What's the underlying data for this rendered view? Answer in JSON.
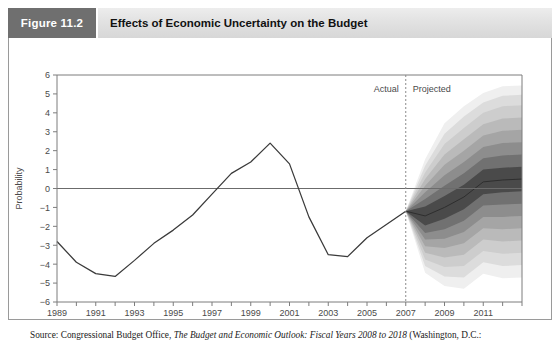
{
  "figure": {
    "tag_label": "Figure 11.2",
    "title": "Effects of Economic Uncertainty on the Budget",
    "tag_bg": "#6f6f6f",
    "title_bg": "#e2e2e2"
  },
  "source": {
    "prefix": "Source: Congressional Budget Office, ",
    "italic_title": "The Budget and Economic Outlook: Fiscal Years 2008 to 2018",
    "suffix": " (Washington, D.C.:"
  },
  "annotations": {
    "actual_label": "Actual",
    "projected_label": "Projected",
    "divider_year": 2007
  },
  "chart_data": {
    "type": "line",
    "title": "Effects of Economic Uncertainty on the Budget",
    "xlabel": "",
    "ylabel": "Probability",
    "xlim": [
      1989,
      2013
    ],
    "ylim": [
      -6,
      6
    ],
    "grid": false,
    "legend": "none",
    "zero_line": 0,
    "x_ticks": [
      1989,
      1990,
      1991,
      1992,
      1993,
      1994,
      1995,
      1996,
      1997,
      1998,
      1999,
      2000,
      2001,
      2002,
      2003,
      2004,
      2005,
      2006,
      2007,
      2008,
      2009,
      2010,
      2011,
      2012,
      2013
    ],
    "x_tick_labels": [
      "1989",
      "",
      "1991",
      "",
      "1993",
      "",
      "1995",
      "",
      "1997",
      "",
      "1999",
      "",
      "2001",
      "",
      "2003",
      "",
      "2005",
      "",
      "2007",
      "",
      "2009",
      "",
      "2011",
      "",
      ""
    ],
    "y_ticks": [
      -6,
      -5,
      -4,
      -3,
      -2,
      -1,
      0,
      1,
      2,
      3,
      4,
      5,
      6
    ],
    "y_tick_labels": [
      "−6",
      "−5",
      "−4",
      "−3",
      "−2",
      "−1",
      "0",
      "1",
      "2",
      "3",
      "4",
      "5",
      "6"
    ],
    "series": [
      {
        "name": "Actual",
        "x": [
          1989,
          1990,
          1991,
          1992,
          1993,
          1994,
          1995,
          1996,
          1997,
          1998,
          1999,
          2000,
          2001,
          2002,
          2003,
          2004,
          2005,
          2006,
          2007
        ],
        "values": [
          -2.8,
          -3.9,
          -4.5,
          -4.65,
          -3.8,
          -2.9,
          -2.2,
          -1.4,
          -0.3,
          0.8,
          1.4,
          2.4,
          1.3,
          -1.5,
          -3.5,
          -3.6,
          -2.6,
          -1.9,
          -1.2
        ]
      }
    ],
    "fan": {
      "name": "Projected uncertainty fan",
      "x": [
        2007,
        2008,
        2009,
        2010,
        2011,
        2012,
        2013
      ],
      "median": [
        -1.2,
        -1.45,
        -1.0,
        -0.45,
        0.35,
        0.45,
        0.5
      ],
      "bands": [
        {
          "label": "innermost",
          "shade": "#4a4a4a",
          "lower": [
            -1.2,
            -1.95,
            -1.6,
            -1.1,
            -0.3,
            -0.2,
            -0.15
          ],
          "upper": [
            -1.2,
            -0.95,
            -0.4,
            0.2,
            1.0,
            1.1,
            1.15
          ]
        },
        {
          "label": "band-2",
          "shade": "#717171",
          "lower": [
            -1.2,
            -2.35,
            -2.15,
            -1.7,
            -0.9,
            -0.85,
            -0.8
          ],
          "upper": [
            -1.2,
            -0.55,
            0.15,
            0.8,
            1.6,
            1.75,
            1.8
          ]
        },
        {
          "label": "band-3",
          "shade": "#8d8d8d",
          "lower": [
            -1.2,
            -2.7,
            -2.65,
            -2.3,
            -1.5,
            -1.5,
            -1.45
          ],
          "upper": [
            -1.2,
            -0.2,
            0.7,
            1.4,
            2.2,
            2.4,
            2.45
          ]
        },
        {
          "label": "band-4",
          "shade": "#a5a5a5",
          "lower": [
            -1.2,
            -3.05,
            -3.15,
            -2.9,
            -2.1,
            -2.15,
            -2.1
          ],
          "upper": [
            -1.2,
            0.15,
            1.25,
            2.0,
            2.8,
            3.05,
            3.1
          ]
        },
        {
          "label": "band-5",
          "shade": "#bababa",
          "lower": [
            -1.2,
            -3.4,
            -3.65,
            -3.5,
            -2.7,
            -2.8,
            -2.75
          ],
          "upper": [
            -1.2,
            0.5,
            1.8,
            2.6,
            3.4,
            3.7,
            3.75
          ]
        },
        {
          "label": "band-6",
          "shade": "#cdcdcd",
          "lower": [
            -1.2,
            -3.75,
            -4.15,
            -4.1,
            -3.3,
            -3.45,
            -3.4
          ],
          "upper": [
            -1.2,
            0.85,
            2.35,
            3.2,
            4.0,
            4.35,
            4.4
          ]
        },
        {
          "label": "band-7",
          "shade": "#dcdcdc",
          "lower": [
            -1.2,
            -4.1,
            -4.65,
            -4.7,
            -3.9,
            -4.1,
            -4.05
          ],
          "upper": [
            -1.2,
            1.2,
            2.9,
            3.8,
            4.55,
            4.9,
            4.95
          ]
        },
        {
          "label": "outermost",
          "shade": "#efefef",
          "lower": [
            -1.2,
            -4.45,
            -5.15,
            -5.3,
            -4.5,
            -4.75,
            -4.7
          ],
          "upper": [
            -1.2,
            1.55,
            3.45,
            4.35,
            5.05,
            5.4,
            5.45
          ]
        }
      ]
    },
    "colors": {
      "line": "#3a3a3a",
      "axis": "#7d7d7d",
      "zero_line": "#6b6b6b",
      "divider": "#8a8a8a",
      "tick_text": "#4a4a4a"
    }
  }
}
